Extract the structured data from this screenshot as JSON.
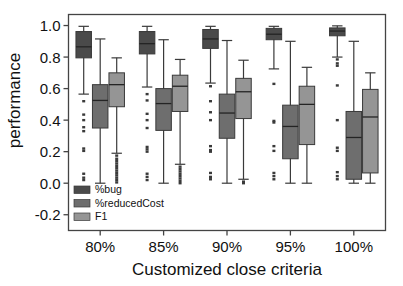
{
  "chart_data": {
    "type": "box",
    "title": "",
    "xlabel": "Customized close criteria",
    "ylabel": "performance",
    "categories": [
      "80%",
      "85%",
      "90%",
      "95%",
      "100%"
    ],
    "ylim": [
      -0.3,
      1.07
    ],
    "yticks": [
      1.0,
      0.8,
      0.6,
      0.4,
      0.2,
      0.0,
      -0.2
    ],
    "ytick_labels": [
      "1.0",
      "0.8",
      "0.6",
      "0.4",
      "0.2",
      "0.0",
      "-0.2"
    ],
    "grid": false,
    "legend_position": "lower-left-inside",
    "series": [
      {
        "name": "%bug",
        "color": "#4a4a4a",
        "boxes": [
          {
            "category": "80%",
            "whisker_low": 0.565,
            "q1": 0.795,
            "median": 0.865,
            "q3": 0.962,
            "whisker_high": 0.995,
            "outliers": [
              0.52,
              0.435,
              0.4,
              0.355,
              0.33,
              0.22,
              0.205,
              0.06,
              0.035,
              0.02
            ]
          },
          {
            "category": "85%",
            "whisker_low": 0.61,
            "q1": 0.82,
            "median": 0.885,
            "q3": 0.962,
            "whisker_high": 0.995,
            "outliers": [
              0.565,
              0.525,
              0.44,
              0.4,
              0.35,
              0.23,
              0.215,
              0.2,
              0.06,
              0.04,
              0.02
            ]
          },
          {
            "category": "90%",
            "whisker_low": 0.635,
            "q1": 0.855,
            "median": 0.915,
            "q3": 0.975,
            "whisker_high": 0.995,
            "outliers": [
              0.615,
              0.52,
              0.45,
              0.4,
              0.235,
              0.21,
              0.2,
              0.065,
              0.04,
              0.025
            ]
          },
          {
            "category": "95%",
            "whisker_low": 0.725,
            "q1": 0.91,
            "median": 0.945,
            "q3": 0.982,
            "whisker_high": 0.995,
            "outliers": [
              0.63,
              0.395,
              0.385,
              0.235,
              0.205,
              0.065,
              0.045,
              0.025
            ]
          },
          {
            "category": "100%",
            "whisker_low": 0.8,
            "q1": 0.935,
            "median": 0.965,
            "q3": 0.985,
            "whisker_high": 0.998,
            "outliers": [
              0.785,
              0.76,
              0.745,
              0.62,
              0.4,
              0.225,
              0.205,
              0.07,
              0.045,
              0.025
            ]
          }
        ]
      },
      {
        "name": "%reducedCost",
        "color": "#6e6e6e",
        "boxes": [
          {
            "category": "80%",
            "whisker_low": 0.0,
            "q1": 0.35,
            "median": 0.525,
            "q3": 0.625,
            "whisker_high": 0.915,
            "outliers": []
          },
          {
            "category": "85%",
            "whisker_low": 0.0,
            "q1": 0.335,
            "median": 0.505,
            "q3": 0.6,
            "whisker_high": 0.91,
            "outliers": []
          },
          {
            "category": "90%",
            "whisker_low": 0.0,
            "q1": 0.285,
            "median": 0.445,
            "q3": 0.565,
            "whisker_high": 0.905,
            "outliers": []
          },
          {
            "category": "95%",
            "whisker_low": 0.0,
            "q1": 0.155,
            "median": 0.36,
            "q3": 0.495,
            "whisker_high": 0.9,
            "outliers": []
          },
          {
            "category": "100%",
            "whisker_low": 0.0,
            "q1": 0.025,
            "median": 0.29,
            "q3": 0.455,
            "whisker_high": 0.9,
            "outliers": []
          }
        ]
      },
      {
        "name": "F1",
        "color": "#959595",
        "boxes": [
          {
            "category": "80%",
            "whisker_low": 0.19,
            "q1": 0.485,
            "median": 0.625,
            "q3": 0.7,
            "whisker_high": 0.795,
            "outliers": [
              0.175,
              0.155,
              0.14,
              0.125,
              0.11,
              0.095,
              0.08,
              0.065,
              0.05,
              0.035,
              0.02,
              0.005
            ]
          },
          {
            "category": "85%",
            "whisker_low": 0.12,
            "q1": 0.455,
            "median": 0.615,
            "q3": 0.685,
            "whisker_high": 0.785,
            "outliers": [
              0.105,
              0.09,
              0.075,
              0.06,
              0.045,
              0.03,
              0.015,
              0.0
            ]
          },
          {
            "category": "90%",
            "whisker_low": 0.025,
            "q1": 0.41,
            "median": 0.58,
            "q3": 0.665,
            "whisker_high": 0.78,
            "outliers": [
              0.01,
              0.0
            ]
          },
          {
            "category": "95%",
            "whisker_low": 0.0,
            "q1": 0.245,
            "median": 0.5,
            "q3": 0.615,
            "whisker_high": 0.735,
            "outliers": []
          },
          {
            "category": "100%",
            "whisker_low": 0.0,
            "q1": 0.065,
            "median": 0.42,
            "q3": 0.595,
            "whisker_high": 0.7,
            "outliers": []
          }
        ]
      }
    ]
  },
  "axes": {
    "y_label": "performance",
    "x_label": "Customized close criteria"
  },
  "legend": {
    "entries": [
      {
        "label": "%bug",
        "color": "#4a4a4a"
      },
      {
        "label": "%reducedCost",
        "color": "#6e6e6e"
      },
      {
        "label": "F1",
        "color": "#959595"
      }
    ]
  }
}
